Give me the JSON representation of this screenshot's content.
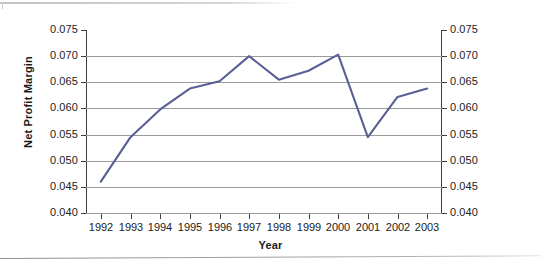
{
  "chart_data": {
    "type": "line",
    "title": "",
    "xlabel": "Year",
    "ylabel": "Net Profit Margin",
    "categories": [
      "1992",
      "1993",
      "1994",
      "1995",
      "1996",
      "1997",
      "1998",
      "1999",
      "2000",
      "2001",
      "2002",
      "2003"
    ],
    "series": [
      {
        "name": "Net Profit Margin",
        "color": "#5a5f96",
        "values": [
          0.046,
          0.0545,
          0.0598,
          0.0638,
          0.0652,
          0.07,
          0.0655,
          0.0672,
          0.0703,
          0.0545,
          0.0622,
          0.0638
        ]
      }
    ],
    "ylim": [
      0.04,
      0.075
    ],
    "ytick_step": 0.005,
    "ytick_labels": [
      "0.075",
      "0.070",
      "0.065",
      "0.060",
      "0.055",
      "0.050",
      "0.045",
      "0.040"
    ],
    "ytick_values": [
      0.075,
      0.07,
      0.065,
      0.06,
      0.055,
      0.05,
      0.045,
      0.04
    ],
    "right_axis_mirrors_left": true,
    "right_ytick_labels": [
      "0.075",
      "0.070",
      "0.065",
      "0.060",
      "0.055",
      "0.050",
      "0.045",
      "0.040"
    ],
    "grid": "horizontal",
    "legend": "none",
    "markers": "none"
  },
  "colors": {
    "series_line": "#5a5f96",
    "gridline": "#9a9a9a",
    "axis": "#3f3f3f",
    "text": "#222222",
    "background": "#ffffff"
  }
}
